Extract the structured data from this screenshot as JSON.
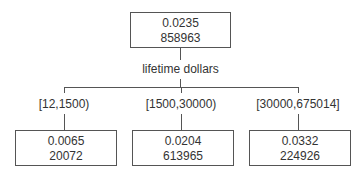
{
  "root": {
    "rate": "0.0235",
    "count": "858963"
  },
  "split_variable": "lifetime dollars",
  "children": [
    {
      "range": "[12,1500)",
      "rate": "0.0065",
      "count": "20072"
    },
    {
      "range": "[1500,30000)",
      "rate": "0.0204",
      "count": "613965"
    },
    {
      "range": "[30000,675014]",
      "rate": "0.0332",
      "count": "224926"
    }
  ]
}
